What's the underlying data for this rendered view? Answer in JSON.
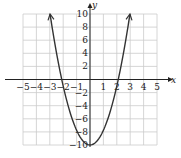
{
  "chart_data": {
    "type": "line",
    "title": "",
    "xlabel": "x",
    "ylabel": "y",
    "xlim": [
      -5,
      5
    ],
    "ylim": [
      -10,
      10
    ],
    "grid": true,
    "x_ticks": [
      -5,
      -4,
      -3,
      -2,
      -1,
      1,
      2,
      3,
      4,
      5
    ],
    "x_tick_labels": [
      "−5",
      "−4",
      "−3",
      "−2",
      "−1",
      "1",
      "2",
      "3",
      "4",
      "5"
    ],
    "y_ticks": [
      10,
      8,
      6,
      4,
      2,
      -2,
      -4,
      -6,
      -8,
      -10
    ],
    "y_tick_labels": [
      "10",
      "8",
      "6",
      "4",
      "2",
      "−2",
      "−4",
      "−6",
      "−8",
      "−10"
    ],
    "series": [
      {
        "name": "parabola",
        "equation_estimate": "y = 2.25x^2 - 10",
        "vertex": [
          0,
          -10
        ],
        "x_intercepts_estimate": [
          -2.1,
          2.1
        ],
        "arrow_ends": [
          [
            -3.0,
            10
          ],
          [
            3.0,
            10
          ]
        ],
        "x": [
          -3,
          -2.5,
          -2,
          -1.5,
          -1,
          -0.5,
          0,
          0.5,
          1,
          1.5,
          2,
          2.5,
          3
        ],
        "values": [
          10.25,
          4.06,
          -1,
          -4.94,
          -7.75,
          -9.44,
          -10,
          -9.44,
          -7.75,
          -4.94,
          -1,
          4.06,
          10.25
        ]
      }
    ],
    "colors": {
      "curve": "#333333",
      "axis": "#222222",
      "grid": "#cccccc"
    }
  }
}
